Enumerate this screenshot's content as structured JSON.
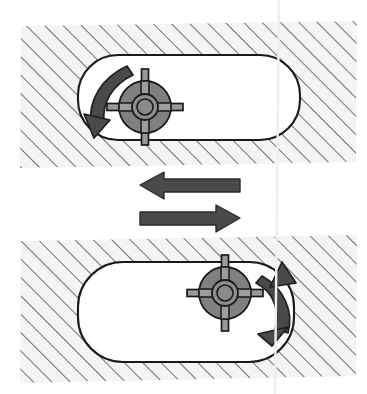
{
  "figure": {
    "type": "mechanical-diagram",
    "background_color": "#ffffff",
    "panels": [
      {
        "id": "top-panel",
        "label": "Top stage",
        "hatched_block": {
          "name": "hatched-body",
          "fill": "#f4f4f4",
          "hatch_color": "#5a5a5a",
          "hatch_angle_deg": -45,
          "hatch_spacing_px": 13,
          "x": 20,
          "y": 22,
          "width": 336,
          "height": 145
        },
        "slot": {
          "name": "slot-cavity",
          "fill": "#ffffff",
          "stroke": "#1a1a1a",
          "x": 78,
          "y": 55,
          "width": 222,
          "height": 85,
          "corner_radius": 40
        },
        "rotor": {
          "name": "rotor",
          "center_x": 145,
          "center_y": 107,
          "radius": 26,
          "hub_outer_radius": 13,
          "hub_inner_radius": 8,
          "spoke_count": 4,
          "spoke_length": 38,
          "spoke_width": 7,
          "body_fill": "#808080",
          "spoke_fill": "#9a9a9a",
          "stroke": "#1a1a1a"
        },
        "rotation_arrow": {
          "name": "rotation-arrow-ccw",
          "direction": "counter-clockwise",
          "fill": "#4a4a4a",
          "stroke": "#1a1a1a"
        }
      },
      {
        "id": "bottom-panel",
        "label": "Bottom stage",
        "hatched_block": {
          "name": "hatched-body",
          "fill": "#f4f4f4",
          "hatch_color": "#5a5a5a",
          "hatch_angle_deg": -45,
          "hatch_spacing_px": 13,
          "x": 20,
          "y": 238,
          "width": 336,
          "height": 144
        },
        "slot": {
          "name": "slot-cavity",
          "fill": "#ffffff",
          "stroke": "#1a1a1a",
          "x": 78,
          "y": 262,
          "width": 216,
          "height": 100,
          "corner_radius": 45
        },
        "rotor": {
          "name": "rotor",
          "center_x": 225,
          "center_y": 293,
          "radius": 26,
          "hub_outer_radius": 13,
          "hub_inner_radius": 8,
          "spoke_count": 4,
          "spoke_length": 38,
          "spoke_width": 7,
          "body_fill": "#808080",
          "spoke_fill": "#9a9a9a",
          "stroke": "#1a1a1a"
        },
        "rotation_arrow": {
          "name": "rotation-arrow-cw",
          "direction": "clockwise",
          "fill": "#4a4a4a",
          "stroke": "#1a1a1a"
        }
      }
    ],
    "translation_arrows": [
      {
        "name": "translation-arrow-left",
        "direction": "left",
        "fill": "#4a4a4a",
        "stroke": "#2b2b2b",
        "x": 140,
        "y": 175,
        "width": 100,
        "height": 20
      },
      {
        "name": "translation-arrow-right",
        "direction": "right",
        "fill": "#4a4a4a",
        "stroke": "#2b2b2b",
        "x": 140,
        "y": 208,
        "width": 100,
        "height": 20
      }
    ],
    "crease": {
      "name": "paper-crease",
      "orientation": "vertical",
      "x": 277,
      "color": "#efefef"
    }
  }
}
